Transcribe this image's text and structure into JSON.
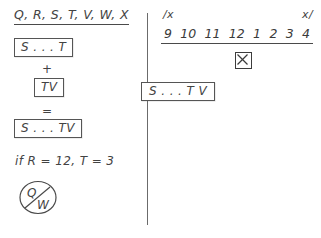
{
  "page": {
    "background_color": "#ffffff",
    "ink_color": "#434343"
  },
  "left_panel": {
    "title": "Q, R, S, T, V, W, X",
    "equation": {
      "operand_1": "S . . . T",
      "operator_plus": "+",
      "operand_2": "TV",
      "operator_equals": "=",
      "result": "S . . . TV"
    },
    "condition": "if R = 12, T = 3",
    "circled_glyph": {
      "top_letter": "Q",
      "bottom_letter": "W"
    }
  },
  "right_panel": {
    "tick_label_left": "/x",
    "tick_label_right": "x/",
    "number_line": [
      "9",
      "10",
      "11",
      "12",
      "1",
      "2",
      "3",
      "4"
    ],
    "marker_label": "X",
    "straddling_box": "S . . . T  V"
  }
}
